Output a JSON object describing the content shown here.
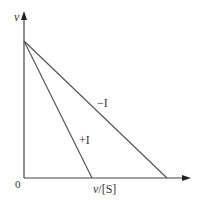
{
  "diagram": {
    "type": "eadie-hofstee-plot",
    "y_axis_label": "v",
    "x_axis_label_italic": "v",
    "x_axis_label_rest": "/[S]",
    "origin_label": "0",
    "lines": [
      {
        "name": "plus-inhibitor",
        "label": "+I",
        "y_intercept_px": [
          24,
          41
        ],
        "x_intercept_px": [
          92,
          178
        ]
      },
      {
        "name": "minus-inhibitor",
        "label": "−I",
        "y_intercept_px": [
          24,
          41
        ],
        "x_intercept_px": [
          167,
          178
        ]
      }
    ],
    "colors": {
      "axis": "#333333",
      "line": "#555555",
      "text": "#333333"
    }
  }
}
